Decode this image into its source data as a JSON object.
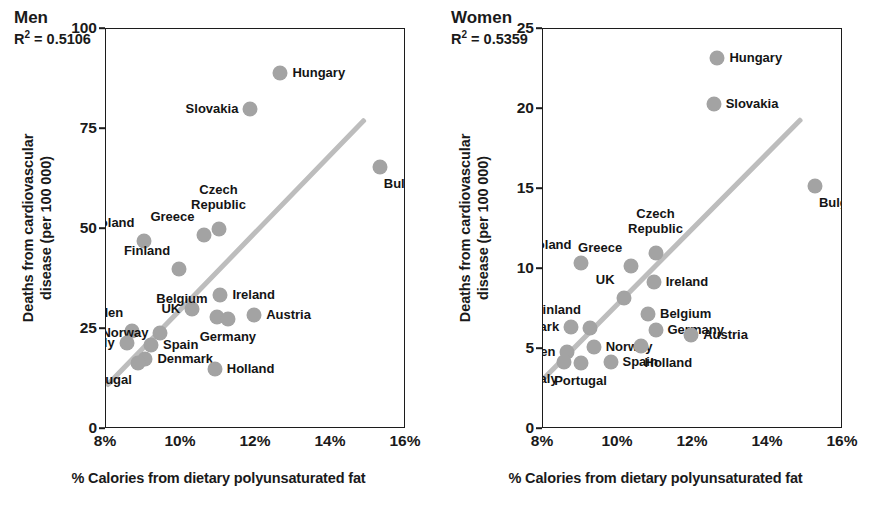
{
  "figure": {
    "xlabel": "% Calories from dietary polyunsaturated fat",
    "ylabel_line1": "Deaths from cardiovascular",
    "ylabel_line2": "disease (per 100 000)",
    "marker_color": "#a3a3a3",
    "trend_color": "#bdbdbd",
    "axis_color": "#1c1c1c"
  },
  "chart_data": [
    {
      "type": "scatter",
      "title": "Men",
      "r_squared_label": "R² = 0.5106",
      "r_squared": 0.5106,
      "xlabel": "% Calories from dietary polyunsaturated fat",
      "ylabel": "Deaths from cardiovascular disease (per 100 000)",
      "xlim": [
        8,
        16
      ],
      "ylim": [
        0,
        100
      ],
      "xticks": [
        "8%",
        "10%",
        "12%",
        "14%",
        "16%"
      ],
      "xtick_values": [
        8,
        10,
        12,
        14,
        16
      ],
      "yticks": [
        "0",
        "25",
        "50",
        "75",
        "100"
      ],
      "ytick_values": [
        0,
        25,
        50,
        75,
        100
      ],
      "grid": false,
      "legend": "none",
      "trendline": {
        "x0": 8.0,
        "y0": 10.8,
        "x1": 14.9,
        "y1": 77.5
      },
      "points": [
        {
          "name": "Hungary",
          "x": 12.65,
          "y": 89.0,
          "label_pos": "right"
        },
        {
          "name": "Slovakia",
          "x": 11.85,
          "y": 80.0,
          "label_pos": "left"
        },
        {
          "name": "Bulgaria",
          "x": 15.3,
          "y": 65.5,
          "label_pos": "below-right"
        },
        {
          "name": "Czech Republic",
          "x": 11.0,
          "y": 50.0,
          "label_pos": "above"
        },
        {
          "name": "Greece",
          "x": 10.6,
          "y": 48.5,
          "label_pos": "above-left"
        },
        {
          "name": "Poland",
          "x": 9.0,
          "y": 47.0,
          "label_pos": "above-left"
        },
        {
          "name": "Finland",
          "x": 9.95,
          "y": 40.0,
          "label_pos": "above-left"
        },
        {
          "name": "Ireland",
          "x": 11.05,
          "y": 33.5,
          "label_pos": "right"
        },
        {
          "name": "UK",
          "x": 10.3,
          "y": 30.0,
          "label_pos": "left"
        },
        {
          "name": "Belgium",
          "x": 10.95,
          "y": 28.0,
          "label_pos": "above-left"
        },
        {
          "name": "Germany",
          "x": 11.25,
          "y": 27.5,
          "label_pos": "below"
        },
        {
          "name": "Austria",
          "x": 11.95,
          "y": 28.5,
          "label_pos": "right"
        },
        {
          "name": "Sweden",
          "x": 8.7,
          "y": 24.5,
          "label_pos": "above-left"
        },
        {
          "name": "Norway",
          "x": 9.45,
          "y": 24.0,
          "label_pos": "left"
        },
        {
          "name": "Italy",
          "x": 8.55,
          "y": 21.5,
          "label_pos": "left"
        },
        {
          "name": "Spain",
          "x": 9.2,
          "y": 21.0,
          "label_pos": "right"
        },
        {
          "name": "Denmark",
          "x": 9.05,
          "y": 17.5,
          "label_pos": "right"
        },
        {
          "name": "Portugal",
          "x": 8.85,
          "y": 16.5,
          "label_pos": "below-left"
        },
        {
          "name": "Holland",
          "x": 10.9,
          "y": 15.0,
          "label_pos": "right"
        }
      ]
    },
    {
      "type": "scatter",
      "title": "Women",
      "r_squared_label": "R² = 0.5359",
      "r_squared": 0.5359,
      "xlabel": "% Calories from dietary polyunsaturated fat",
      "ylabel": "Deaths from cardiovascular disease (per 100 000)",
      "xlim": [
        8,
        16
      ],
      "ylim": [
        0,
        25
      ],
      "xticks": [
        "8%",
        "10%",
        "12%",
        "14%",
        "16%"
      ],
      "xtick_values": [
        8,
        10,
        12,
        14,
        16
      ],
      "yticks": [
        "0",
        "5",
        "10",
        "15",
        "20",
        "25"
      ],
      "ytick_values": [
        0,
        5,
        10,
        15,
        20,
        25
      ],
      "grid": false,
      "legend": "none",
      "trendline": {
        "x0": 8.0,
        "y0": 3.1,
        "x1": 14.9,
        "y1": 19.4
      },
      "points": [
        {
          "name": "Hungary",
          "x": 12.65,
          "y": 23.2,
          "label_pos": "right"
        },
        {
          "name": "Slovakia",
          "x": 12.55,
          "y": 20.3,
          "label_pos": "right"
        },
        {
          "name": "Bulgaria",
          "x": 15.25,
          "y": 15.2,
          "label_pos": "below-right"
        },
        {
          "name": "Czech Republic",
          "x": 11.0,
          "y": 11.0,
          "label_pos": "above"
        },
        {
          "name": "Poland",
          "x": 9.0,
          "y": 10.4,
          "label_pos": "above-left"
        },
        {
          "name": "Greece",
          "x": 10.35,
          "y": 10.2,
          "label_pos": "above-left"
        },
        {
          "name": "Ireland",
          "x": 10.95,
          "y": 9.2,
          "label_pos": "right"
        },
        {
          "name": "UK",
          "x": 10.15,
          "y": 8.2,
          "label_pos": "above-left"
        },
        {
          "name": "Belgium",
          "x": 10.8,
          "y": 7.2,
          "label_pos": "right"
        },
        {
          "name": "Denmark",
          "x": 8.75,
          "y": 6.4,
          "label_pos": "left"
        },
        {
          "name": "Finland",
          "x": 9.25,
          "y": 6.3,
          "label_pos": "above-left"
        },
        {
          "name": "Germany",
          "x": 11.0,
          "y": 6.2,
          "label_pos": "right"
        },
        {
          "name": "Austria",
          "x": 11.95,
          "y": 5.9,
          "label_pos": "right"
        },
        {
          "name": "Sweden",
          "x": 8.65,
          "y": 4.8,
          "label_pos": "left"
        },
        {
          "name": "Norway",
          "x": 9.35,
          "y": 5.1,
          "label_pos": "right"
        },
        {
          "name": "Holland",
          "x": 10.6,
          "y": 5.2,
          "label_pos": "below-right"
        },
        {
          "name": "Italy",
          "x": 8.55,
          "y": 4.2,
          "label_pos": "below-left"
        },
        {
          "name": "Portugal",
          "x": 9.0,
          "y": 4.1,
          "label_pos": "below"
        },
        {
          "name": "Spain",
          "x": 9.8,
          "y": 4.2,
          "label_pos": "right"
        }
      ]
    }
  ]
}
